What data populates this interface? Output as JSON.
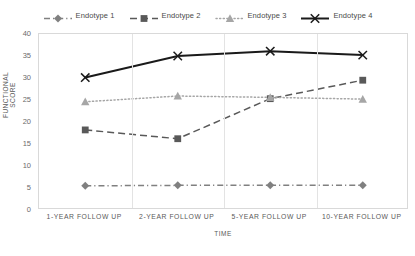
{
  "chart_data": {
    "type": "line",
    "title": "",
    "xlabel": "TIME",
    "ylabel": "FUNCTIONAL SCORE",
    "categories": [
      "1-YEAR FOLLOW UP",
      "2-YEAR FOLLOW UP",
      "5-YEAR FOLLOW UP",
      "10-YEAR FOLLOW UP"
    ],
    "yticks": [
      0,
      5,
      10,
      15,
      20,
      25,
      30,
      35,
      40
    ],
    "ylim": [
      0,
      40
    ],
    "grid": "vertical",
    "legend_position": "top",
    "series": [
      {
        "name": "Endotype 1",
        "values": [
          5.5,
          5.6,
          5.6,
          5.6
        ],
        "color": "#808080",
        "dash": "dashdot",
        "marker": "diamond"
      },
      {
        "name": "Endotype 2",
        "values": [
          18.2,
          16.2,
          25.3,
          29.5
        ],
        "color": "#595959",
        "dash": "dashed",
        "marker": "square"
      },
      {
        "name": "Endotype 3",
        "values": [
          24.6,
          25.9,
          25.6,
          25.2
        ],
        "color": "#a6a6a6",
        "dash": "dotted",
        "marker": "triangle"
      },
      {
        "name": "Endotype 4",
        "values": [
          30.1,
          35.0,
          36.1,
          35.2
        ],
        "color": "#1a1a1a",
        "dash": "solid",
        "marker": "x"
      }
    ]
  }
}
